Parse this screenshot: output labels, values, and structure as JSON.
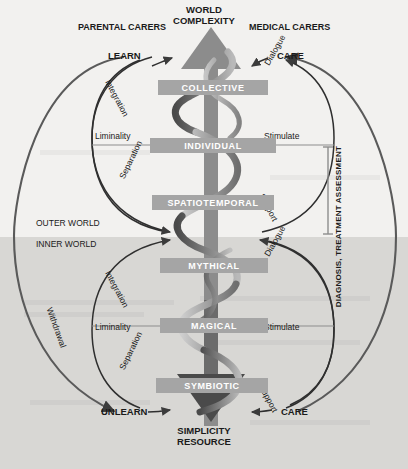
{
  "diagram": {
    "top_label_line1": "WORLD",
    "top_label_line2": "COMPLEXITY",
    "bottom_label_line1": "SIMPLICITY",
    "bottom_label_line2": "RESOURCE",
    "left_heading": "PARENTAL CARERS",
    "right_heading": "MEDICAL CARERS",
    "world_split": {
      "outer": "OUTER WORLD",
      "inner": "INNER WORLD"
    },
    "right_caption": "DIAGNOSIS, TREATMENT ASSESSMENT",
    "actions": {
      "top_left": "LEARN",
      "top_right": "CARE",
      "bottom_left": "UNLEARN",
      "bottom_right": "CARE"
    },
    "stages": [
      {
        "id": "collective",
        "label": "COLLECTIVE"
      },
      {
        "id": "individual",
        "label": "INDIVIDUAL"
      },
      {
        "id": "spatiotemporal",
        "label": "SPATIOTEMPORAL"
      },
      {
        "id": "mythical",
        "label": "MYTHICAL"
      },
      {
        "id": "magical",
        "label": "MAGICAL"
      },
      {
        "id": "symbiotic",
        "label": "SYMBIOTIC"
      }
    ],
    "arc_labels": {
      "upper_left_top": "Integration",
      "upper_left_mid": "Liminality",
      "upper_left_bottom": "Separation",
      "upper_right_top": "Dialogue",
      "upper_right_mid": "Stimulate",
      "upper_right_bottom": "Support",
      "lower_left_top": "Integration",
      "lower_left_mid": "Liminality",
      "lower_left_bottom": "Separation",
      "lower_right_top": "Dialogue",
      "lower_right_mid": "Stimulate",
      "lower_right_bottom": "Support",
      "outer_left": "Withdrawal"
    },
    "colors": {
      "background_outer": "#f2f1ef",
      "background_inner": "#d8d7d4",
      "bar_fill": "#a5a5a5",
      "bar_text": "#ffffff",
      "arrow_up": "#8c8c8c",
      "arrow_down": "#4a4a4a",
      "stroke": "#3b3b3b"
    }
  }
}
